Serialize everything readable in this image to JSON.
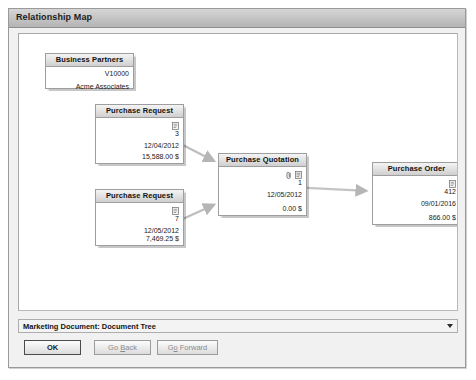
{
  "window": {
    "title": "Relationship Map"
  },
  "diagram": {
    "nodes": [
      {
        "id": "business-partners",
        "title": "Business Partners",
        "code": "V10000",
        "name": "Acme Associates"
      },
      {
        "id": "purchase-request-1",
        "title": "Purchase Request",
        "doc_number": "3",
        "date": "12/04/2012",
        "amount": "15,588.00 $",
        "icons": [
          "document-icon"
        ]
      },
      {
        "id": "purchase-request-2",
        "title": "Purchase Request",
        "doc_number": "7",
        "date": "12/05/2012",
        "amount": "7,469.25 $",
        "icons": [
          "document-icon"
        ]
      },
      {
        "id": "purchase-quotation",
        "title": "Purchase Quotation",
        "doc_number": "1",
        "date": "12/05/2012",
        "amount": "0.00 $",
        "icons": [
          "paperclip-icon",
          "document-icon"
        ]
      },
      {
        "id": "purchase-order",
        "title": "Purchase Order",
        "doc_number": "412",
        "date": "09/01/2016",
        "amount": "866.00 $",
        "icons": [
          "document-icon"
        ]
      }
    ],
    "links": [
      {
        "from": "purchase-request-1",
        "to": "purchase-quotation"
      },
      {
        "from": "purchase-request-2",
        "to": "purchase-quotation"
      },
      {
        "from": "purchase-quotation",
        "to": "purchase-order"
      }
    ]
  },
  "view_selector": {
    "value": "Marketing Document: Document Tree",
    "arrow": "chevron-down-icon"
  },
  "footer": {
    "ok_label": "OK",
    "back_label_pre": "Go ",
    "back_label_mnem": "B",
    "back_label_post": "ack",
    "forward_label_pre": "G",
    "forward_label_mnem": "o",
    "forward_label_post": " Forward"
  },
  "colors": {
    "window_bg": "#f1f1f1",
    "canvas_bg": "#ffffff",
    "node_border": "#9e9e9e",
    "link": "#b0b0b0",
    "title_bar": "#c6c6c6"
  }
}
